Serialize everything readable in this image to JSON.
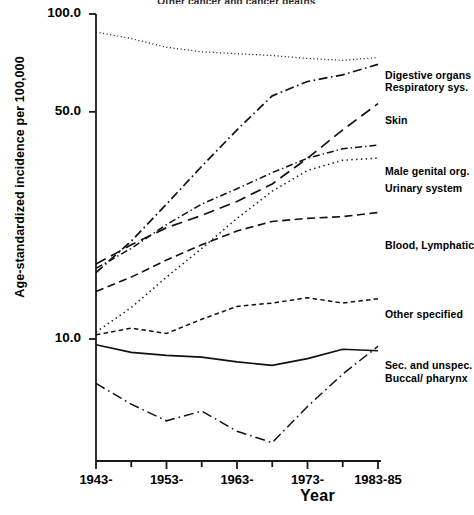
{
  "chart_data": {
    "type": "line",
    "title": "Other cancer and cancer deaths",
    "ylabel": "Age-standardized incidence per 100,000",
    "xlabel": "Year",
    "yscale": "log",
    "ylim": [
      4.0,
      105.0
    ],
    "ytick_values": [
      100.0,
      50.0,
      10.0
    ],
    "ytick_labels": [
      "100.0",
      "50.0",
      "10.0"
    ],
    "grid": false,
    "legend_position": "right",
    "x": [
      1943,
      1948,
      1953,
      1958,
      1963,
      1968,
      1973,
      1978,
      1983
    ],
    "xtick_labels": [
      "1943-",
      "1953-",
      "1963-",
      "1973-",
      "1983-85"
    ],
    "xtick_values": [
      1943,
      1953,
      1963,
      1973,
      1983
    ],
    "series": [
      {
        "name": "Digestive organs",
        "style": "fine-dotted",
        "values": [
          88.0,
          84.0,
          79.0,
          76.5,
          75.5,
          74.5,
          73.0,
          72.0,
          73.5
        ]
      },
      {
        "name": "Respiratory sys.",
        "style": "dash-dot",
        "values": [
          16.0,
          20.0,
          26.0,
          34.0,
          44.0,
          56.0,
          62.0,
          65.0,
          70.0
        ]
      },
      {
        "name": "Skin",
        "style": "long-dash",
        "values": [
          17.0,
          19.5,
          22.0,
          24.0,
          26.5,
          30.0,
          36.0,
          44.0,
          53.0
        ]
      },
      {
        "name": "Male genital org.",
        "style": "dash-dot-fine",
        "values": [
          16.5,
          19.0,
          22.5,
          26.0,
          29.0,
          32.5,
          36.0,
          38.5,
          39.5
        ]
      },
      {
        "name": "Urinary system",
        "style": "dotted",
        "values": [
          10.5,
          12.5,
          15.5,
          19.0,
          23.5,
          28.5,
          33.0,
          35.5,
          36.0
        ]
      },
      {
        "name": "Blood, Lymphatic",
        "style": "dashed",
        "values": [
          14.0,
          15.5,
          17.5,
          19.5,
          21.5,
          23.0,
          23.5,
          23.8,
          24.5
        ]
      },
      {
        "name": "Other specified",
        "style": "short-dash",
        "values": [
          10.3,
          10.8,
          10.4,
          11.5,
          12.6,
          12.9,
          13.4,
          12.9,
          13.3
        ]
      },
      {
        "name": "Sec. and unspec.",
        "style": "solid",
        "values": [
          9.6,
          9.1,
          8.9,
          8.8,
          8.5,
          8.3,
          8.7,
          9.3,
          9.2
        ]
      },
      {
        "name": "Buccal/ pharynx",
        "style": "dash-dot-long",
        "values": [
          7.3,
          6.3,
          5.6,
          6.0,
          5.2,
          4.8,
          6.2,
          7.8,
          9.5
        ]
      }
    ],
    "legend_labels": [
      "Digestive organs",
      "Respiratory sys.",
      "Skin",
      "Male genital org.",
      "Urinary system",
      "Blood, Lymphatic",
      "Other specified",
      "Sec. and unspec.",
      "Buccal/ pharynx"
    ]
  }
}
